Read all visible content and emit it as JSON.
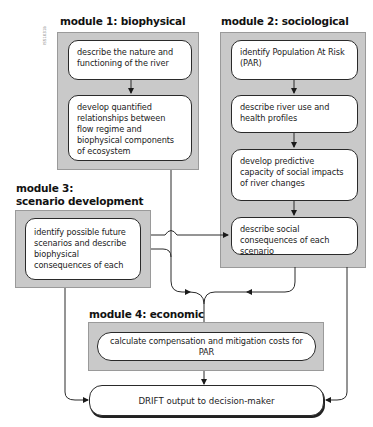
{
  "figure_code": "ISS1031b",
  "modules": [
    {
      "heading": "module 1: biophysical",
      "steps": [
        "describe the nature and functioning of the river",
        "develop quantified relationships between flow regime and biophysical components of ecosystem"
      ]
    },
    {
      "heading": "module 2: sociological",
      "steps": [
        "identify Population At Risk (PAR)",
        "describe river use and health profiles",
        "develop predictive capacity of social impacts of river changes",
        "describe social consequences of each scenario"
      ]
    },
    {
      "heading_line1": "module 3:",
      "heading_line2": "scenario development",
      "steps": [
        "identify possible future scenarios and describe biophysical consequences of each"
      ]
    },
    {
      "heading": "module 4: economic",
      "steps": [
        "calculate compensation and mitigation costs for PAR"
      ]
    }
  ],
  "output": {
    "label": "DRIFT output to decision-maker"
  },
  "colors": {
    "module_fill": "#c9c9c9",
    "module_border": "#9a9a9a",
    "step_fill": "#ffffff",
    "line": "#2a2a2a"
  }
}
